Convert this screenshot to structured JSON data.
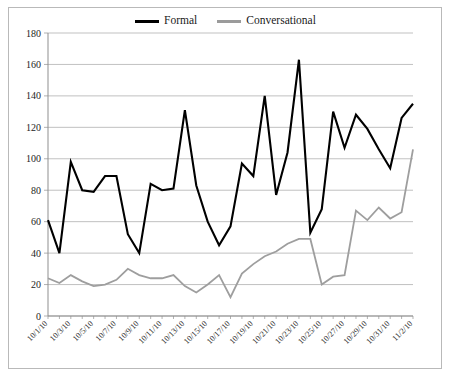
{
  "legend": {
    "entries": [
      {
        "label": "Formal",
        "color": "#000000"
      },
      {
        "label": "Conversational",
        "color": "#9e9e9e"
      }
    ]
  },
  "axes": {
    "y_ticks": [
      "180",
      "160",
      "140",
      "120",
      "100",
      "80",
      "60",
      "40",
      "20",
      "0"
    ],
    "x_ticks": [
      "10/1/10",
      "10/3/10",
      "10/5/10",
      "10/7/10",
      "10/9/10",
      "10/11/10",
      "10/13/10",
      "10/15/10",
      "10/17/10",
      "10/19/10",
      "10/21/10",
      "10/23/10",
      "10/25/10",
      "10/27/10",
      "10/29/10",
      "10/31/10",
      "11/2/10"
    ]
  },
  "chart_data": {
    "type": "line",
    "title": "",
    "xlabel": "",
    "ylabel": "",
    "ylim": [
      0,
      180
    ],
    "ytick_step": 20,
    "grid": true,
    "legend_position": "top-center",
    "categories": [
      "10/1/10",
      "10/2/10",
      "10/3/10",
      "10/4/10",
      "10/5/10",
      "10/6/10",
      "10/7/10",
      "10/8/10",
      "10/9/10",
      "10/10/10",
      "10/11/10",
      "10/12/10",
      "10/13/10",
      "10/14/10",
      "10/15/10",
      "10/16/10",
      "10/17/10",
      "10/18/10",
      "10/19/10",
      "10/20/10",
      "10/21/10",
      "10/22/10",
      "10/23/10",
      "10/24/10",
      "10/25/10",
      "10/26/10",
      "10/27/10",
      "10/28/10",
      "10/29/10",
      "10/30/10",
      "10/31/10",
      "11/1/10",
      "11/2/10"
    ],
    "series": [
      {
        "name": "Formal",
        "color": "#000000",
        "values": [
          61,
          40,
          98,
          80,
          79,
          89,
          89,
          52,
          40,
          84,
          80,
          81,
          131,
          83,
          60,
          45,
          57,
          97,
          89,
          140,
          77,
          104,
          163,
          53,
          68,
          130,
          107,
          128,
          119,
          106,
          94,
          126,
          135
        ]
      },
      {
        "name": "Conversational",
        "color": "#9e9e9e",
        "values": [
          24,
          21,
          26,
          22,
          19,
          20,
          23,
          30,
          26,
          24,
          24,
          26,
          19,
          15,
          20,
          26,
          12,
          27,
          33,
          38,
          41,
          46,
          49,
          49,
          20,
          25,
          26,
          67,
          61,
          69,
          62,
          66,
          106
        ]
      }
    ]
  }
}
